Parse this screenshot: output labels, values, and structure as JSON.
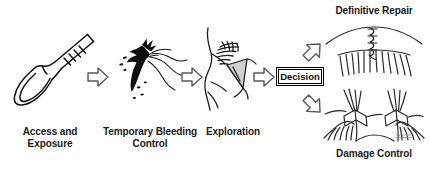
{
  "figure": {
    "type": "flowchart",
    "orientation": "left-to-right with terminal branch",
    "background_color": "#ffffff",
    "line_color": "#000000",
    "style": "hand-drawn medical illustration"
  },
  "steps": [
    {
      "id": "access",
      "label": "Access and\nExposure",
      "illustration": "scalpel-icon",
      "illustration_description": "surgical scalpel with ridged handle, blade pointing down-left"
    },
    {
      "id": "bleeding",
      "label": "Temporary Bleeding\nControl",
      "illustration": "bleeding-vessel-icon",
      "illustration_description": "black ink blot depicting active hemorrhage from a vessel"
    },
    {
      "id": "exploration",
      "label": "Exploration",
      "illustration": "vessel-exploration-icon",
      "illustration_description": "opened wound edge with retractor exposing vessel"
    }
  ],
  "decision": {
    "label": "Decision",
    "shape": "double-bordered-rectangle"
  },
  "outcomes": [
    {
      "id": "definitive-repair",
      "label": "Definitive Repair",
      "position": "top",
      "illustration": "sutured-vessel-icon",
      "illustration_description": "vessel closed with interrupted suture line over tissue bed"
    },
    {
      "id": "damage-control",
      "label": "Damage Control",
      "position": "bottom",
      "illustration": "clamped-vessel-icon",
      "illustration_description": "two surgical clamps or ligatures placed on divided vessel ends"
    }
  ],
  "arrows": [
    {
      "id": "arrow-access-to-bleeding",
      "direction": "right",
      "style": "hollow-outline"
    },
    {
      "id": "arrow-bleeding-to-exploration",
      "direction": "right",
      "style": "hollow-outline"
    },
    {
      "id": "arrow-exploration-to-decision",
      "direction": "right",
      "style": "hollow-outline"
    },
    {
      "id": "arrow-decision-to-repair",
      "direction": "up-right",
      "style": "hollow-outline"
    },
    {
      "id": "arrow-decision-to-damage-control",
      "direction": "down-right",
      "style": "hollow-outline"
    }
  ],
  "signature": {
    "text": "",
    "description": "faint artist signature at lower right of damage control illustration"
  }
}
